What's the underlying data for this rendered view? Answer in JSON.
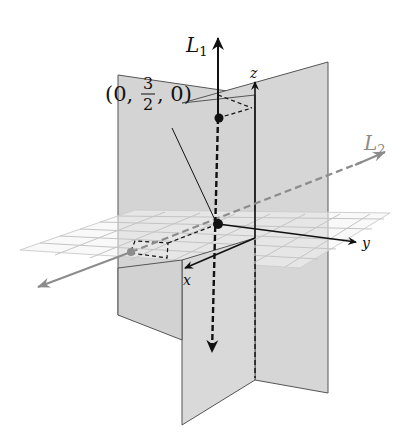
{
  "figure": {
    "axes": {
      "x": "x",
      "y": "y",
      "z": "z"
    },
    "lines": {
      "L1": {
        "name": "L",
        "subscript": "1",
        "color": "#111111",
        "style": "solid above, dashed below"
      },
      "L2": {
        "name": "L",
        "subscript": "2",
        "color": "#8c8c8c",
        "style": "dashed"
      }
    },
    "point_label": {
      "open": "(0, ",
      "numerator": "3",
      "denominator": "2",
      "close": ", 0)"
    },
    "colors": {
      "plane_fill": "#d9d9d9",
      "plane_fill_back": "#cfcfcf",
      "grid": "#c8c8c8",
      "axis": "#111111",
      "line2": "#8c8c8c"
    }
  }
}
